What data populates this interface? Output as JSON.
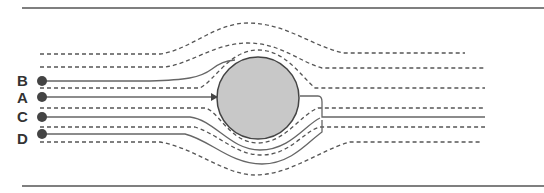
{
  "diagram": {
    "type": "streamlines-around-cylinder",
    "labels": [
      {
        "id": "B",
        "text": "B",
        "y": 81
      },
      {
        "id": "A",
        "text": "A",
        "y": 97
      },
      {
        "id": "C",
        "text": "C",
        "y": 117
      },
      {
        "id": "D",
        "text": "D",
        "y": 134
      }
    ],
    "colors": {
      "border": "#555555",
      "dashed": "#555555",
      "solid": "#666666",
      "cylinder_fill": "#c8c8c8",
      "cylinder_stroke": "#444444",
      "dot": "#444444"
    },
    "cylinder": {
      "cx": 258,
      "cy": 98,
      "r": 41
    }
  }
}
